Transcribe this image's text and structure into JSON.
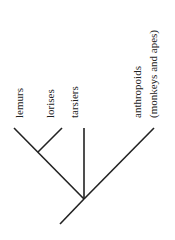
{
  "diagram": {
    "type": "cladogram",
    "taxa": [
      {
        "label": "lemurs"
      },
      {
        "label": "lorises"
      },
      {
        "label": "tarsiers"
      },
      {
        "label": "anthropoids",
        "sublabel": "(monkeys and apes)"
      }
    ],
    "colors": {
      "line": "#222222",
      "text": "#222222",
      "background": "#ffffff"
    }
  }
}
